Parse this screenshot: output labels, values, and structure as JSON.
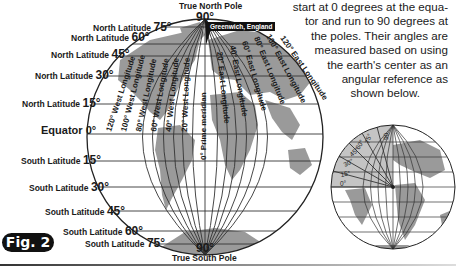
{
  "figure": {
    "badge": "Fig. 2",
    "north_pole_label": "True North Pole",
    "north_pole_degree": "90°",
    "south_pole_label": "True South Pole",
    "south_pole_degree": "90°",
    "greenwich_label": "Greenwich, England",
    "prime_meridian_label": "0° Prime meridian",
    "latitudes": [
      {
        "label": "North Latitude",
        "deg": "75°"
      },
      {
        "label": "North Latitude",
        "deg": "60°"
      },
      {
        "label": "North Latitude",
        "deg": "45°"
      },
      {
        "label": "North Latitude",
        "deg": "30°"
      },
      {
        "label": "North Latitude",
        "deg": "15°"
      },
      {
        "label": "Equator",
        "deg": "0°"
      },
      {
        "label": "South Latitude",
        "deg": "15°"
      },
      {
        "label": "South Latitude",
        "deg": "30°"
      },
      {
        "label": "South Latitude",
        "deg": "45°"
      },
      {
        "label": "South Latitude",
        "deg": "60°"
      },
      {
        "label": "South Latitude",
        "deg": "75°"
      }
    ],
    "west_longitudes": [
      "120° West Longitude",
      "100° West Longitude",
      "80° West Longitude",
      "60° West Longitude",
      "40° West Longitude",
      "20° West Longitude"
    ],
    "east_longitudes": [
      "20° East Longitude",
      "40° East Longitude",
      "60° East Longitude",
      "80° East Longitude",
      "100° East Longitude",
      "120° East Longitude"
    ]
  },
  "paragraph": {
    "lines": [
      "start at 0 degrees at the equa-",
      "tor and run to 90 degrees at",
      "the poles. Their angles are",
      "measured based on using",
      "the earth's center as an",
      "angular reference as",
      "shown below."
    ]
  },
  "small_globe": {
    "angle_labels": [
      "0°",
      "15°",
      "30°",
      "45°",
      "60°",
      "75°",
      "90"
    ]
  },
  "colors": {
    "land": "#9a9a9a",
    "grid": "#333333",
    "badge_bg": "#111111",
    "wedge": "#c4c4c4"
  }
}
